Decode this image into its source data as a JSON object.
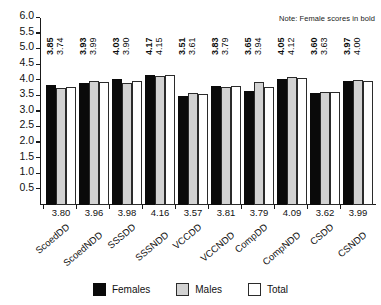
{
  "note": "Note: Female scores in bold",
  "legend": {
    "items": [
      {
        "label": "Females",
        "color": "#0a0a0a",
        "key": "females"
      },
      {
        "label": "Males",
        "color": "#d2d2d2",
        "key": "males"
      },
      {
        "label": "Total",
        "color": "#ffffff",
        "key": "total"
      }
    ]
  },
  "chart_data": {
    "type": "bar",
    "title": "",
    "xlabel": "",
    "ylabel": "",
    "ylim": [
      0,
      6.0
    ],
    "yticks": [
      "0.5",
      "1.0",
      "1.5",
      "2.0",
      "2.5",
      "3.0",
      "3.5",
      "4.0",
      "4.5",
      "5.0",
      "5.5",
      "6.0"
    ],
    "grid": false,
    "legend_position": "bottom",
    "annotations": [
      "Note: Female scores in bold"
    ],
    "categories": [
      "ScoedDD",
      "ScoedNDD",
      "SSSDD",
      "SSSNDD",
      "VCCDD",
      "VCCNDD",
      "CompDD",
      "CompNDD",
      "CSDD",
      "CSNDD"
    ],
    "series": [
      {
        "name": "Females",
        "color": "#0a0a0a",
        "values": [
          3.85,
          3.93,
          4.03,
          4.17,
          3.51,
          3.83,
          3.65,
          4.05,
          3.6,
          3.97
        ],
        "labels": [
          "3.85",
          "3.93",
          "4.03",
          "4.17",
          "3.51",
          "3.83",
          "3.65",
          "4.05",
          "3.60",
          "3.97"
        ]
      },
      {
        "name": "Males",
        "color": "#d2d2d2",
        "values": [
          3.74,
          3.99,
          3.9,
          4.15,
          3.61,
          3.79,
          3.94,
          4.12,
          3.63,
          4.0
        ],
        "labels": [
          "3.74",
          "3.99",
          "3.90",
          "4.15",
          "3.61",
          "3.79",
          "3.94",
          "4.12",
          "3.63",
          "4.00"
        ]
      },
      {
        "name": "Total",
        "color": "#ffffff",
        "values": [
          3.8,
          3.96,
          3.98,
          4.16,
          3.57,
          3.81,
          3.79,
          4.09,
          3.62,
          3.99
        ],
        "labels": [
          "3.80",
          "3.96",
          "3.98",
          "4.16",
          "3.57",
          "3.81",
          "3.79",
          "4.09",
          "3.62",
          "3.99"
        ]
      }
    ]
  }
}
